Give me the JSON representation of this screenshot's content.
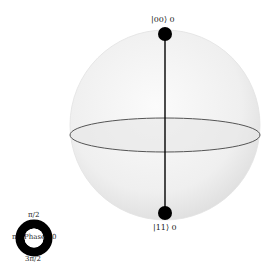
{
  "qsphere": {
    "states": [
      {
        "label": "|00⟩ 0",
        "ket": "|00⟩",
        "phase_value": "0",
        "position": "top"
      },
      {
        "label": "|11⟩ 0",
        "ket": "|11⟩",
        "phase_value": "0",
        "position": "bottom"
      }
    ],
    "colors": {
      "sphere_fill": "#eeeeee",
      "equator": "#555555",
      "state_dot": "#000000",
      "state_line": "#000000"
    }
  },
  "phase_legend": {
    "center_label": "Phase",
    "labels": {
      "top": "π/2",
      "left": "π",
      "right": "0",
      "bottom": "3π/2"
    },
    "ring_color": "#000000"
  }
}
